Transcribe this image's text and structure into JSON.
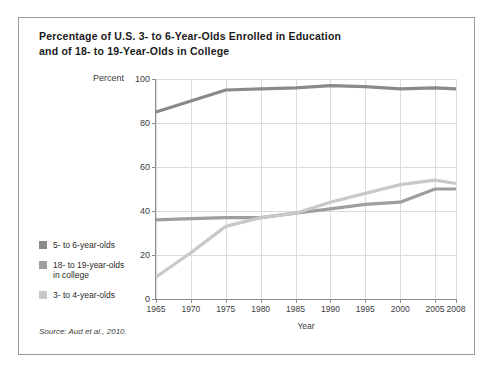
{
  "figure": {
    "title_line1": "Percentage of U.S. 3- to 6-Year-Olds Enrolled in Education",
    "title_line2": "and of 18- to 19-Year-Olds in College",
    "source": "Source: Aud et al., 2010."
  },
  "chart_data": {
    "type": "line",
    "title": "Percentage of U.S. 3- to 6-Year-Olds Enrolled in Education and of 18- to 19-Year-Olds in College",
    "xlabel": "Year",
    "ylabel": "Percent",
    "x": [
      1965,
      1970,
      1975,
      1980,
      1985,
      1990,
      1995,
      2000,
      2005,
      2008
    ],
    "categories": [
      "1965",
      "1970",
      "1975",
      "1980",
      "1985",
      "1990",
      "1995",
      "2000",
      "2005",
      "2008"
    ],
    "xlim": [
      1965,
      2008
    ],
    "ylim": [
      0,
      100
    ],
    "yticks": [
      0,
      20,
      40,
      60,
      80,
      100
    ],
    "grid": true,
    "legend_position": "left-outside",
    "series": [
      {
        "name": "5- to 6-year-olds",
        "color": "#8a8a8a",
        "values": [
          85,
          90,
          95,
          95.5,
          96,
          97,
          96.5,
          95.5,
          96,
          95.5
        ]
      },
      {
        "name": "18- to 19-year-olds in college",
        "color": "#9e9e9e",
        "values": [
          36,
          36.5,
          37,
          37,
          39,
          41,
          43,
          44,
          50,
          50
        ]
      },
      {
        "name": "3- to 4-year-olds",
        "color": "#c8c8c8",
        "values": [
          10,
          21,
          33,
          37,
          39,
          44,
          48,
          52,
          54,
          52.5
        ]
      }
    ]
  },
  "legend": {
    "items": [
      {
        "label": "5- to 6-year-olds",
        "label2": "",
        "color": "#8a8a8a"
      },
      {
        "label": "18- to 19-year-olds",
        "label2": "in college",
        "color": "#9e9e9e"
      },
      {
        "label": "3- to 4-year-olds",
        "label2": "",
        "color": "#c8c8c8"
      }
    ]
  }
}
